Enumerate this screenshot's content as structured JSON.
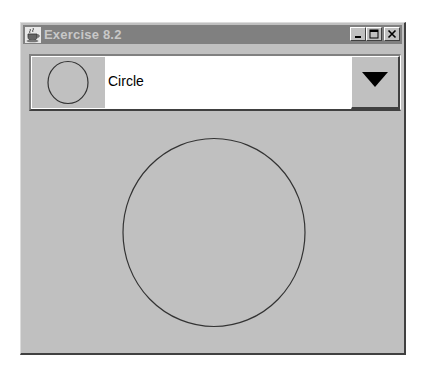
{
  "window": {
    "title": "Exercise 8.2",
    "title_icon": "java-coffee-cup-icon",
    "buttons": {
      "minimize": "minimize-icon",
      "maximize": "maximize-icon",
      "close": "close-icon"
    }
  },
  "combo": {
    "selected_label": "Circle",
    "selected_icon": "circle-icon",
    "arrow_icon": "triangle-down-icon"
  },
  "canvas": {
    "shape": "circle",
    "stroke_color": "#000000",
    "fill": "none"
  },
  "colors": {
    "panel_bg": "#c0c0c0",
    "titlebar_inactive": "#808080",
    "title_text": "#c8c8c8"
  }
}
